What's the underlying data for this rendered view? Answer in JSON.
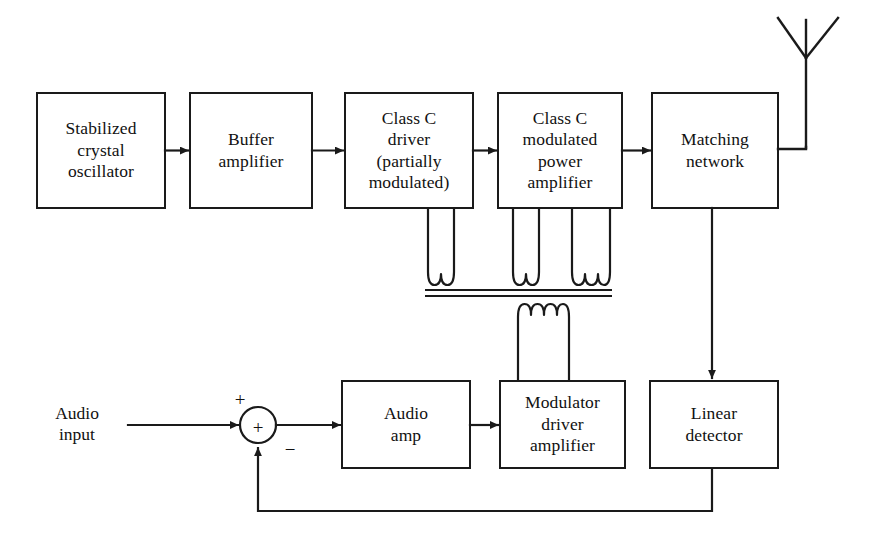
{
  "diagram": {
    "stroke_color": "#1a1a1a",
    "text_color": "#111111",
    "background_color": "#ffffff",
    "blocks": [
      {
        "id": "stabilized-crystal-oscillator",
        "label": "Stabilized\ncrystal\noscillator",
        "x": 37,
        "y": 93,
        "w": 128,
        "h": 115
      },
      {
        "id": "buffer-amplifier",
        "label": "Buffer\namplifier",
        "x": 190,
        "y": 93,
        "w": 122,
        "h": 115
      },
      {
        "id": "class-c-driver",
        "label": "Class C\ndriver\n(partially\nmodulated)",
        "x": 345,
        "y": 93,
        "w": 128,
        "h": 115
      },
      {
        "id": "class-c-modulated-power-amplifier",
        "label": "Class C\nmodulated\npower\namplifier",
        "x": 498,
        "y": 93,
        "w": 124,
        "h": 115
      },
      {
        "id": "matching-network",
        "label": "Matching\nnetwork",
        "x": 652,
        "y": 93,
        "w": 126,
        "h": 115
      },
      {
        "id": "audio-amp",
        "label": "Audio\namp",
        "x": 342,
        "y": 381,
        "w": 128,
        "h": 87
      },
      {
        "id": "modulator-driver-amplifier",
        "label": "Modulator\ndriver\namplifier",
        "x": 500,
        "y": 381,
        "w": 125,
        "h": 87
      },
      {
        "id": "linear-detector",
        "label": "Linear\ndetector",
        "x": 650,
        "y": 381,
        "w": 128,
        "h": 87
      }
    ],
    "free_labels": [
      {
        "id": "audio-input",
        "label": "Audio\ninput",
        "x": 31,
        "y": 403,
        "w": 92
      }
    ],
    "summing_junction": {
      "id": "summing-junction",
      "cx": 258,
      "cy": 425,
      "r": 18,
      "inner_glyph": "+",
      "plus_sign": "+",
      "minus_sign": "−"
    },
    "antenna": {
      "id": "antenna",
      "type": "dipole-whip"
    },
    "transformer": {
      "id": "modulation-transformer",
      "primary_windings": [
        {
          "owner": "class-c-driver",
          "loops": 1
        },
        {
          "owner": "class-c-modulated-power-amplifier",
          "loops": 1
        },
        {
          "owner": "class-c-modulated-power-amplifier",
          "loops": 2
        }
      ],
      "secondary_windings": [
        {
          "owner": "modulator-driver-amplifier",
          "loops": 3
        }
      ],
      "core_bars": 2
    },
    "signal_flow": [
      "stabilized-crystal-oscillator",
      "buffer-amplifier",
      "class-c-driver",
      "class-c-modulated-power-amplifier",
      "matching-network",
      "antenna"
    ],
    "feedback_flow": [
      "matching-network",
      "linear-detector",
      "summing-junction"
    ],
    "audio_flow": [
      "audio-input",
      "summing-junction",
      "audio-amp",
      "modulator-driver-amplifier",
      "modulation-transformer"
    ]
  }
}
